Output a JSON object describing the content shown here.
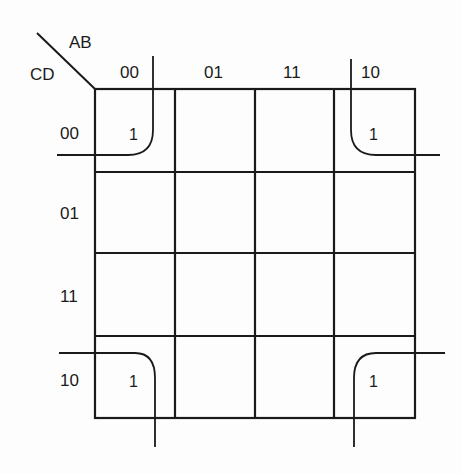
{
  "kmap": {
    "row_variables": "CD",
    "col_variables": "AB",
    "col_headers": [
      "00",
      "01",
      "11",
      "10"
    ],
    "row_headers": [
      "00",
      "01",
      "11",
      "10"
    ],
    "cells": [
      [
        "1",
        "",
        "",
        "1"
      ],
      [
        "",
        "",
        "",
        ""
      ],
      [
        "",
        "",
        "",
        ""
      ],
      [
        "1",
        "",
        "",
        "1"
      ]
    ],
    "grouping": "four-corner loop (AB=00/10, CD=00/10)"
  },
  "style": {
    "line_color": "#1a1a1a",
    "background": "#fdfdfd"
  }
}
